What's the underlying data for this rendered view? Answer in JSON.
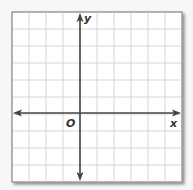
{
  "diagram": {
    "type": "coordinate-plane",
    "labels": {
      "x_axis": "x",
      "y_axis": "y",
      "origin": "O"
    },
    "grid": {
      "columns": 10,
      "rows": 10,
      "cell_size_px": 17,
      "cols_left_of_y_axis": 4,
      "rows_above_x_axis": 6
    },
    "colors": {
      "background": "#f7f7f7",
      "panel": "#ffffff",
      "grid_line": "#d6d6d6",
      "border": "#9a9a9a",
      "axis": "#444444",
      "shadow": "#b5b5b5"
    }
  }
}
